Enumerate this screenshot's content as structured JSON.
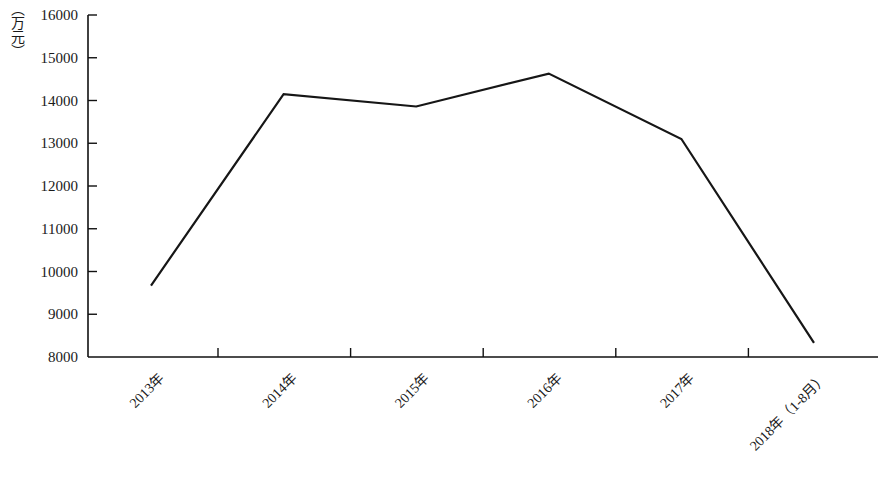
{
  "chart_data": {
    "type": "line",
    "title": "",
    "subtitle": "",
    "xlabel": "",
    "ylabel": "（万元）",
    "unit_label": "（万元）",
    "categories": [
      "2013年",
      "2014年",
      "2015年",
      "2016年",
      "2017年",
      "2018年（1-8月）"
    ],
    "series": [
      {
        "name": "",
        "values": [
          9670,
          14150,
          13860,
          14630,
          13100,
          8330
        ]
      }
    ],
    "ylim": [
      8000,
      16000
    ],
    "ytick_step": 1000,
    "yticks": [
      8000,
      9000,
      10000,
      11000,
      12000,
      13000,
      14000,
      15000,
      16000
    ],
    "ytick_labels": [
      "8000",
      "9000",
      "10000",
      "11000",
      "12000",
      "13000",
      "14000",
      "15000",
      "16000"
    ],
    "xtick_labels_rotation_deg": -45,
    "grid": false,
    "legend": false,
    "legend_position": "none",
    "line_color": "#161616",
    "axis_color": "#111111",
    "background_color": "#ffffff"
  }
}
